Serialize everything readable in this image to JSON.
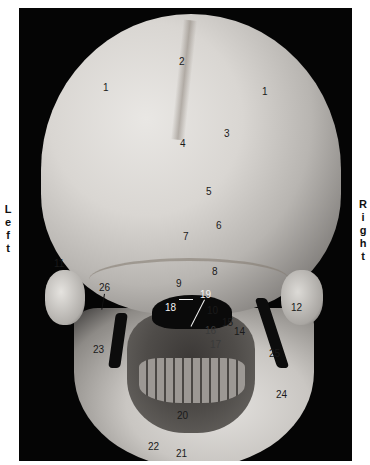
{
  "orientation": {
    "left_letters": [
      "L",
      "e",
      "f",
      "t"
    ],
    "right_letters": [
      "R",
      "i",
      "g",
      "h",
      "t"
    ]
  },
  "figure": {
    "labels": [
      {
        "id": "1a",
        "text": "1",
        "x": 84,
        "y": 74,
        "tone": "dark"
      },
      {
        "id": "1b",
        "text": "1",
        "x": 243,
        "y": 78,
        "tone": "dark"
      },
      {
        "id": "2",
        "text": "2",
        "x": 160,
        "y": 48,
        "tone": "dark"
      },
      {
        "id": "3",
        "text": "3",
        "x": 205,
        "y": 120,
        "tone": "dark"
      },
      {
        "id": "4",
        "text": "4",
        "x": 161,
        "y": 130,
        "tone": "dark"
      },
      {
        "id": "5",
        "text": "5",
        "x": 187,
        "y": 178,
        "tone": "dark"
      },
      {
        "id": "6",
        "text": "6",
        "x": 197,
        "y": 212,
        "tone": "dark"
      },
      {
        "id": "7",
        "text": "7",
        "x": 164,
        "y": 223,
        "tone": "dark"
      },
      {
        "id": "8",
        "text": "8",
        "x": 193,
        "y": 258,
        "tone": "dark"
      },
      {
        "id": "9",
        "text": "9",
        "x": 157,
        "y": 270,
        "tone": "dark"
      },
      {
        "id": "10",
        "text": "10",
        "x": 188,
        "y": 297,
        "tone": "dark"
      },
      {
        "id": "11",
        "text": "11",
        "x": 35,
        "y": 250,
        "tone": "dark"
      },
      {
        "id": "12",
        "text": "12",
        "x": 272,
        "y": 294,
        "tone": "dark"
      },
      {
        "id": "14",
        "text": "14",
        "x": 215,
        "y": 318,
        "tone": "dark"
      },
      {
        "id": "15",
        "text": "15",
        "x": 203,
        "y": 309,
        "tone": "dark"
      },
      {
        "id": "16",
        "text": "16",
        "x": 186,
        "y": 317,
        "tone": "faint"
      },
      {
        "id": "17",
        "text": "17",
        "x": 191,
        "y": 331,
        "tone": "faint"
      },
      {
        "id": "18",
        "text": "18",
        "x": 146,
        "y": 294,
        "tone": "light"
      },
      {
        "id": "19",
        "text": "19",
        "x": 181,
        "y": 281,
        "tone": "light"
      },
      {
        "id": "20",
        "text": "20",
        "x": 158,
        "y": 402,
        "tone": "dark"
      },
      {
        "id": "21",
        "text": "21",
        "x": 157,
        "y": 440,
        "tone": "dark"
      },
      {
        "id": "22",
        "text": "22",
        "x": 129,
        "y": 433,
        "tone": "dark"
      },
      {
        "id": "23",
        "text": "23",
        "x": 74,
        "y": 336,
        "tone": "dark"
      },
      {
        "id": "24",
        "text": "24",
        "x": 257,
        "y": 381,
        "tone": "dark"
      },
      {
        "id": "25",
        "text": "25",
        "x": 250,
        "y": 340,
        "tone": "dark"
      },
      {
        "id": "26",
        "text": "26",
        "x": 80,
        "y": 274,
        "tone": "dark"
      }
    ]
  }
}
